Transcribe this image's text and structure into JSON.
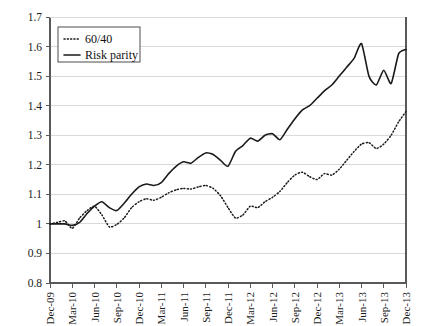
{
  "chart_data": {
    "type": "line",
    "title": "",
    "subtitle": "",
    "xlabel": "",
    "ylabel": "",
    "grid": true,
    "legend_position": "top-left",
    "ylim": [
      0.8,
      1.7
    ],
    "ytick_labels": [
      "1.7",
      "1.6",
      "1.5",
      "1.4",
      "1.3",
      "1.2",
      "1.1",
      "1",
      "0.9",
      "0.8"
    ],
    "ytick_values": [
      1.7,
      1.6,
      1.5,
      1.4,
      1.3,
      1.2,
      1.1,
      1.0,
      0.9,
      0.8
    ],
    "xtick_labels": [
      "Dec-09",
      "Mar-10",
      "Jun-10",
      "Sep-10",
      "Dec-10",
      "Mar-11",
      "Jun-11",
      "Sep-11",
      "Dec-11",
      "Mar-12",
      "Jun-12",
      "Sep-12",
      "Dec-12",
      "Mar-13",
      "Jun-13",
      "Sep-13",
      "Dec-13"
    ],
    "x_tick_rotation": -90,
    "x_start": "Dec-09",
    "x_end": "Dec-13",
    "x_points": 49,
    "legend": [
      {
        "name": "60/40",
        "style": "dotted"
      },
      {
        "name": "Risk parity",
        "style": "solid"
      }
    ],
    "series": [
      {
        "name": "60/40",
        "style": "dotted",
        "values": [
          1.0,
          1.005,
          1.01,
          0.985,
          1.02,
          1.045,
          1.06,
          1.03,
          0.99,
          0.998,
          1.02,
          1.055,
          1.075,
          1.085,
          1.08,
          1.09,
          1.105,
          1.115,
          1.12,
          1.118,
          1.125,
          1.13,
          1.12,
          1.095,
          1.055,
          1.02,
          1.03,
          1.06,
          1.055,
          1.075,
          1.09,
          1.11,
          1.14,
          1.165,
          1.175,
          1.16,
          1.15,
          1.17,
          1.165,
          1.185,
          1.215,
          1.245,
          1.27,
          1.275,
          1.255,
          1.27,
          1.3,
          1.345,
          1.38
        ]
      },
      {
        "name": "Risk parity",
        "style": "solid",
        "values": [
          1.0,
          1.0,
          1.0,
          0.995,
          1.005,
          1.035,
          1.06,
          1.075,
          1.055,
          1.045,
          1.07,
          1.1,
          1.125,
          1.135,
          1.13,
          1.14,
          1.17,
          1.195,
          1.21,
          1.205,
          1.225,
          1.24,
          1.235,
          1.215,
          1.195,
          1.245,
          1.265,
          1.29,
          1.28,
          1.3,
          1.305,
          1.285,
          1.32,
          1.355,
          1.385,
          1.4,
          1.425,
          1.45,
          1.47,
          1.5,
          1.53,
          1.56,
          1.61,
          1.5,
          1.47,
          1.52,
          1.475,
          1.575,
          1.59
        ]
      }
    ]
  }
}
